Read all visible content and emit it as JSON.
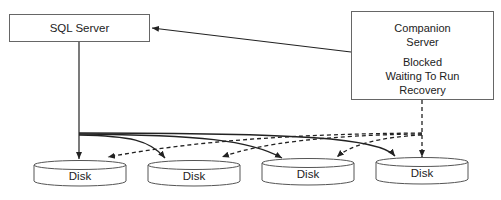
{
  "diagram": {
    "nodes": {
      "sql_server": {
        "label": "SQL Server"
      },
      "companion": {
        "title_line1": "Companion",
        "title_line2": "Server",
        "status_line1": "Blocked",
        "status_line2": "Waiting To Run",
        "status_line3": "Recovery"
      }
    },
    "disks": [
      {
        "label": "Disk"
      },
      {
        "label": "Disk"
      },
      {
        "label": "Disk"
      },
      {
        "label": "Disk"
      }
    ],
    "edges": [
      {
        "from": "companion",
        "to": "sql_server",
        "style": "solid"
      },
      {
        "from": "sql_server",
        "to": "disk1",
        "style": "solid"
      },
      {
        "from": "sql_server",
        "to": "disk2",
        "style": "solid"
      },
      {
        "from": "sql_server",
        "to": "disk3",
        "style": "solid"
      },
      {
        "from": "sql_server",
        "to": "disk4",
        "style": "solid"
      },
      {
        "from": "companion",
        "to": "disk1",
        "style": "dashed"
      },
      {
        "from": "companion",
        "to": "disk2",
        "style": "dashed"
      },
      {
        "from": "companion",
        "to": "disk3",
        "style": "dashed"
      },
      {
        "from": "companion",
        "to": "disk4",
        "style": "dashed"
      }
    ]
  }
}
